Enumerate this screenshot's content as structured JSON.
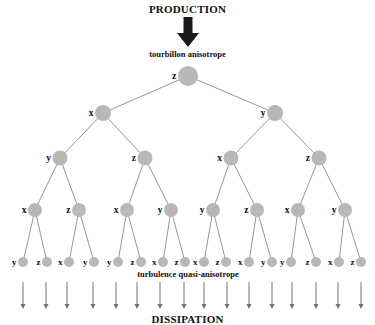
{
  "diagram": {
    "top_title": "PRODUCTION",
    "top_label": "tourbillon anisotrope",
    "bottom_label": "turbulence quasi-anisotrope",
    "bottom_title": "DISSIPATION",
    "colors": {
      "node_fill": "#b8b8b8",
      "edge": "#8a8a8a",
      "big_arrow": "#1a1a1a",
      "small_arrow": "#707070",
      "text": "#111111"
    },
    "tree": {
      "root": {
        "label": "z",
        "x": 188,
        "y": 76,
        "r": 10
      },
      "level1": [
        {
          "label": "x",
          "x": 103,
          "y": 113,
          "r": 8
        },
        {
          "label": "y",
          "x": 275,
          "y": 113,
          "r": 8
        }
      ],
      "level2": [
        {
          "label": "y",
          "x": 60,
          "y": 158,
          "r": 7.5,
          "parent": 0
        },
        {
          "label": "z",
          "x": 145,
          "y": 158,
          "r": 7.5,
          "parent": 0
        },
        {
          "label": "x",
          "x": 231,
          "y": 158,
          "r": 7.5,
          "parent": 1
        },
        {
          "label": "z",
          "x": 319,
          "y": 158,
          "r": 7.5,
          "parent": 1
        }
      ],
      "level3": [
        {
          "label": "x",
          "x": 35,
          "y": 210,
          "r": 7,
          "parent": 0
        },
        {
          "label": "z",
          "x": 79,
          "y": 210,
          "r": 7,
          "parent": 0
        },
        {
          "label": "x",
          "x": 127,
          "y": 210,
          "r": 7,
          "parent": 1
        },
        {
          "label": "y",
          "x": 171,
          "y": 210,
          "r": 7,
          "parent": 1
        },
        {
          "label": "y",
          "x": 213,
          "y": 210,
          "r": 7,
          "parent": 2
        },
        {
          "label": "z",
          "x": 257,
          "y": 210,
          "r": 7,
          "parent": 2
        },
        {
          "label": "x",
          "x": 298,
          "y": 210,
          "r": 7,
          "parent": 3
        },
        {
          "label": "y",
          "x": 345,
          "y": 210,
          "r": 7,
          "parent": 3
        }
      ],
      "leaves": [
        {
          "label": "y",
          "x": 23,
          "y": 262,
          "r": 5,
          "parent": 0
        },
        {
          "label": "z",
          "x": 47,
          "y": 262,
          "r": 5,
          "parent": 0
        },
        {
          "label": "x",
          "x": 69,
          "y": 262,
          "r": 5,
          "parent": 1
        },
        {
          "label": "y",
          "x": 94,
          "y": 262,
          "r": 5,
          "parent": 1
        },
        {
          "label": "y",
          "x": 118,
          "y": 262,
          "r": 5,
          "parent": 2
        },
        {
          "label": "z",
          "x": 141,
          "y": 262,
          "r": 5,
          "parent": 2
        },
        {
          "label": "x",
          "x": 163,
          "y": 262,
          "r": 5,
          "parent": 3
        },
        {
          "label": "z",
          "x": 185,
          "y": 262,
          "r": 5,
          "parent": 3
        },
        {
          "label": "x",
          "x": 204,
          "y": 262,
          "r": 5,
          "parent": 4
        },
        {
          "label": "z",
          "x": 226,
          "y": 262,
          "r": 5,
          "parent": 4
        },
        {
          "label": "x",
          "x": 249,
          "y": 262,
          "r": 5,
          "parent": 5
        },
        {
          "label": "y",
          "x": 272,
          "y": 262,
          "r": 5,
          "parent": 5
        },
        {
          "label": "y",
          "x": 291,
          "y": 262,
          "r": 5,
          "parent": 6
        },
        {
          "label": "z",
          "x": 316,
          "y": 262,
          "r": 5,
          "parent": 6
        },
        {
          "label": "x",
          "x": 339,
          "y": 262,
          "r": 5,
          "parent": 7
        },
        {
          "label": "z",
          "x": 361,
          "y": 262,
          "r": 5,
          "parent": 7
        }
      ]
    },
    "dissipation_arrows": {
      "x": [
        23,
        46,
        67,
        93,
        116,
        137,
        160,
        184,
        204,
        227,
        249,
        272,
        292,
        316,
        338,
        361
      ],
      "y_start": 282,
      "y_end": 309
    },
    "big_arrow": {
      "x": 188,
      "y_top": 17,
      "y_tip": 47
    }
  }
}
